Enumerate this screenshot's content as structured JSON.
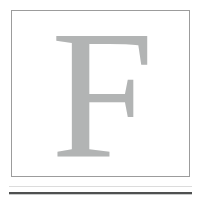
{
  "page": {
    "background_color": "#ffffff",
    "width": 201,
    "height": 204
  },
  "dropcap": {
    "letter": "F",
    "letter_color": "#b2b4b4",
    "frame_border_color": "#9c9c9c",
    "frame_background": "#ffffff",
    "typeface_style": "serif"
  },
  "rules": {
    "faint_rule_color": "#dcdcdc",
    "dark_rule_color": "#4f5050",
    "count": 2
  }
}
